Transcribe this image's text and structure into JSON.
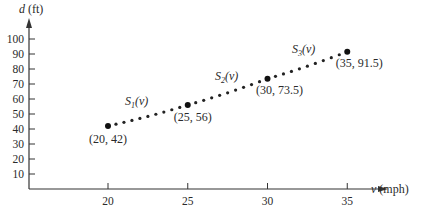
{
  "chart_data": {
    "type": "scatter",
    "title": "",
    "xlabel": "v (mph)",
    "ylabel": "d (ft)",
    "xlabel_var": "v",
    "xlabel_unit": " (mph)",
    "ylabel_var": "d",
    "ylabel_unit": " (ft)",
    "x_ticks": [
      20,
      25,
      30,
      35
    ],
    "y_ticks": [
      10,
      20,
      30,
      40,
      50,
      60,
      70,
      80,
      90,
      100
    ],
    "xlim": [
      14,
      40.5
    ],
    "ylim": [
      0,
      111
    ],
    "grid": false,
    "legend": null,
    "points": [
      {
        "x": 20,
        "y": 42,
        "label": "(20,  42)"
      },
      {
        "x": 25,
        "y": 56,
        "label": "(25,  56)"
      },
      {
        "x": 30,
        "y": 73.5,
        "label": "(30,  73.5)"
      },
      {
        "x": 35,
        "y": 91.5,
        "label": "(35,  91.5)"
      }
    ],
    "segments": [
      {
        "name": "S1(v)",
        "from": [
          20,
          42
        ],
        "to": [
          25,
          56
        ],
        "dots_between": 9
      },
      {
        "name": "S2(v)",
        "from": [
          25,
          56
        ],
        "to": [
          30,
          73.5
        ],
        "dots_between": 9
      },
      {
        "name": "S3(v)",
        "from": [
          30,
          73.5
        ],
        "to": [
          35,
          91.5
        ],
        "dots_between": 9
      }
    ],
    "segment_labels": [
      {
        "base": "S",
        "sub": "1",
        "arg": "(v)"
      },
      {
        "base": "S",
        "sub": "2",
        "arg": "(v)"
      },
      {
        "base": "S",
        "sub": "3",
        "arg": "(v)"
      }
    ]
  }
}
